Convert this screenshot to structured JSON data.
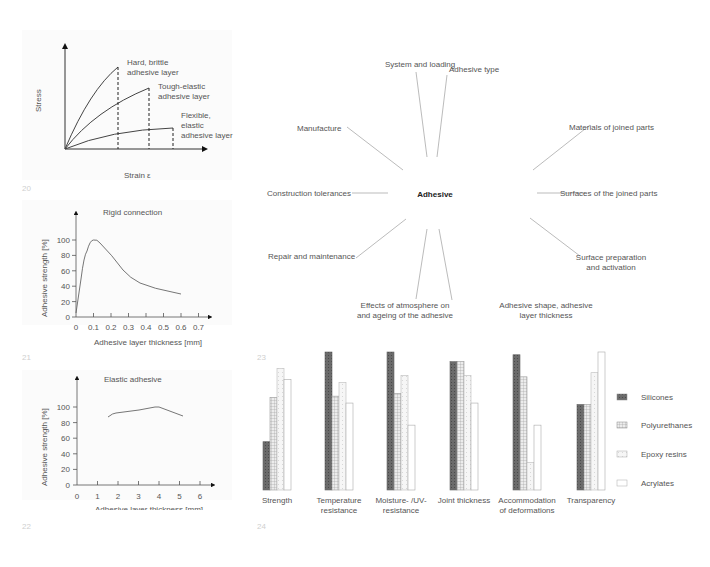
{
  "figures": {
    "fig20": {
      "number": "20",
      "xlabel": "Strain ε",
      "ylabel": "Stress",
      "labels": {
        "hard": [
          "Hard, brittle",
          "adhesive layer"
        ],
        "tough": [
          "Tough-elastic",
          "adhesive layer"
        ],
        "flexible": [
          "Flexible,",
          "elastic",
          "adhesive layer"
        ]
      }
    },
    "fig21": {
      "number": "21",
      "title": "Rigid connection",
      "xlabel": "Adhesive layer thickness [mm]",
      "ylabel": "Adhesive strength [%]",
      "xticks": [
        "0",
        "0.1",
        "0.2",
        "0.3",
        "0.4",
        "0.5",
        "0.6",
        "0.7"
      ],
      "yticks": [
        "0",
        "20",
        "40",
        "60",
        "80",
        "100"
      ]
    },
    "fig22": {
      "number": "22",
      "title": "Elastic adhesive",
      "xlabel": "Adhesive layer thickness [mm]",
      "ylabel": "Adhesive strength [%]",
      "xticks": [
        "0",
        "1",
        "2",
        "3",
        "4",
        "5",
        "6"
      ],
      "yticks": [
        "0",
        "20",
        "40",
        "60",
        "80",
        "100"
      ]
    },
    "fig23": {
      "number": "23",
      "center": "Adhesive",
      "factors": {
        "system_loading": "System and loading",
        "adhesive_type": "Adhesive type",
        "manufacture": "Manufacture",
        "materials": "Materials of joined parts",
        "tolerances": "Construction tolerances",
        "surfaces": "Surfaces of the joined parts",
        "repair": "Repair and maintenance",
        "surface_prep": [
          "Surface preparation",
          "and activation"
        ],
        "atmosphere": [
          "Effects of atmosphere on",
          "and ageing of the adhesive"
        ],
        "shape": [
          "Adhesive shape, adhesive",
          "layer thickness"
        ]
      }
    },
    "fig24": {
      "number": "24",
      "categories_display": [
        [
          "Strength"
        ],
        [
          "Temperature",
          "resistance"
        ],
        [
          "Moisture- /UV-",
          "resistance"
        ],
        [
          "Joint thickness"
        ],
        [
          "Accommodation",
          "of deformations"
        ],
        [
          "Transparency"
        ]
      ],
      "legend": [
        "Silicones",
        "Polyurethanes",
        "Epoxy resins",
        "Acrylates"
      ]
    }
  },
  "chart_data": [
    {
      "type": "line",
      "title": "",
      "xlabel": "Strain ε",
      "ylabel": "Stress",
      "series": [
        {
          "name": "Hard, brittle adhesive layer",
          "x": [
            0,
            0.25,
            0.5,
            0.75,
            1.0
          ],
          "y": [
            0,
            0.42,
            0.72,
            0.9,
            1.0
          ]
        },
        {
          "name": "Tough-elastic adhesive layer",
          "x": [
            0,
            0.4,
            0.8,
            1.2,
            1.6
          ],
          "y": [
            0,
            0.42,
            0.63,
            0.75,
            0.8
          ]
        },
        {
          "name": "Flexible, elastic adhesive layer",
          "x": [
            0,
            0.5,
            1.0,
            1.5,
            2.0
          ],
          "y": [
            0,
            0.15,
            0.21,
            0.24,
            0.26
          ]
        }
      ],
      "grid": false
    },
    {
      "type": "line",
      "title": "Rigid connection",
      "xlabel": "Adhesive layer thickness [mm]",
      "ylabel": "Adhesive strength [%]",
      "x": [
        0,
        0.03,
        0.06,
        0.1,
        0.13,
        0.2,
        0.27,
        0.35,
        0.45,
        0.55,
        0.6
      ],
      "y": [
        5,
        50,
        85,
        100,
        97,
        72,
        52,
        43,
        37,
        33,
        30
      ],
      "xlim": [
        0,
        0.7
      ],
      "ylim": [
        0,
        100
      ],
      "xticks": [
        0,
        0.1,
        0.2,
        0.3,
        0.4,
        0.5,
        0.6,
        0.7
      ],
      "yticks": [
        0,
        20,
        40,
        60,
        80,
        100
      ],
      "grid": false
    },
    {
      "type": "line",
      "title": "Elastic adhesive",
      "xlabel": "Adhesive layer thickness [mm]",
      "ylabel": "Adhesive strength [%]",
      "x": [
        1.5,
        1.9,
        3.0,
        3.8,
        4.0,
        5.2
      ],
      "y": [
        87,
        92,
        96,
        100,
        100,
        88
      ],
      "xlim": [
        0,
        6
      ],
      "ylim": [
        0,
        100
      ],
      "xticks": [
        0,
        1,
        2,
        3,
        4,
        5,
        6
      ],
      "yticks": [
        0,
        20,
        40,
        60,
        80,
        100
      ],
      "grid": false
    },
    {
      "type": "bar",
      "title": "",
      "categories": [
        "Strength",
        "Temperature resistance",
        "Moisture- /UV-resistance",
        "Joint thickness",
        "Accommodation of deformations",
        "Transparency"
      ],
      "series": [
        {
          "name": "Silicones",
          "values": [
            35,
            100,
            100,
            93,
            98,
            62
          ]
        },
        {
          "name": "Polyurethanes",
          "values": [
            67,
            68,
            70,
            93,
            82,
            62
          ]
        },
        {
          "name": "Epoxy resins",
          "values": [
            88,
            78,
            83,
            83,
            20,
            85
          ]
        },
        {
          "name": "Acrylates",
          "values": [
            80,
            63,
            47,
            63,
            47,
            100
          ]
        }
      ],
      "ylim": [
        0,
        100
      ],
      "legend_position": "right",
      "grid": false
    }
  ]
}
